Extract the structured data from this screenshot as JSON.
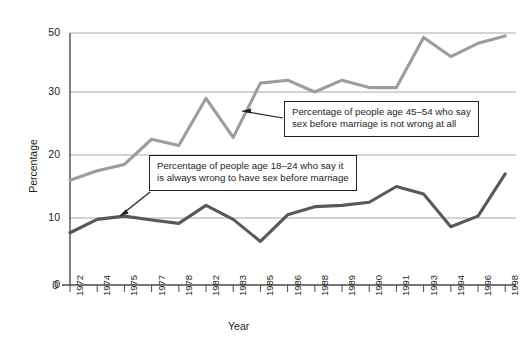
{
  "chart_data": {
    "type": "line",
    "title": "",
    "xlabel": "Year",
    "ylabel": "Percentage",
    "grid": true,
    "legend_position": "inline-callouts",
    "x": [
      "1972",
      "1974",
      "1975",
      "1977",
      "1978",
      "1982",
      "1983",
      "1985",
      "1986",
      "1988",
      "1989",
      "1990",
      "1991",
      "1993",
      "1994",
      "1996",
      "1998"
    ],
    "ylim": [
      0,
      50
    ],
    "ytick_labels": [
      "0",
      "10",
      "20",
      "30",
      "50"
    ],
    "ytick_values": [
      0,
      10,
      20,
      30,
      50
    ],
    "series": [
      {
        "name": "Percentage of people age 45-54 who say sex before marriage is not wrong at all",
        "color": "#9d9d9d",
        "values": [
          16,
          17.5,
          18.5,
          22.5,
          21.5,
          29,
          22.8,
          33,
          34,
          30,
          34,
          31.5,
          31.5,
          48.5,
          42,
          46.5,
          49
        ]
      },
      {
        "name": "Percentage of people age 18-24 who say it is always wrong to have sex before marriage",
        "color": "#595959",
        "values": [
          7.8,
          9.8,
          10.3,
          9.7,
          9.2,
          12,
          9.8,
          6.5,
          10.5,
          11.8,
          12,
          12.5,
          15,
          13.8,
          8.7,
          10.3,
          17
        ]
      }
    ],
    "annotations": [
      {
        "id": "callout-young",
        "lines": [
          "Percentage of people age 18–24 who say it",
          "is always wrong to have sex before marriage"
        ],
        "points_to": "dark-line"
      },
      {
        "id": "callout-older",
        "lines": [
          "Percentage of people age 45–54 who say",
          "sex before marriage is not wrong at all"
        ],
        "points_to": "gray-line"
      }
    ]
  },
  "axis": {
    "y_title": "Percentage",
    "x_title": "Year",
    "zero_origin_label": "0"
  }
}
